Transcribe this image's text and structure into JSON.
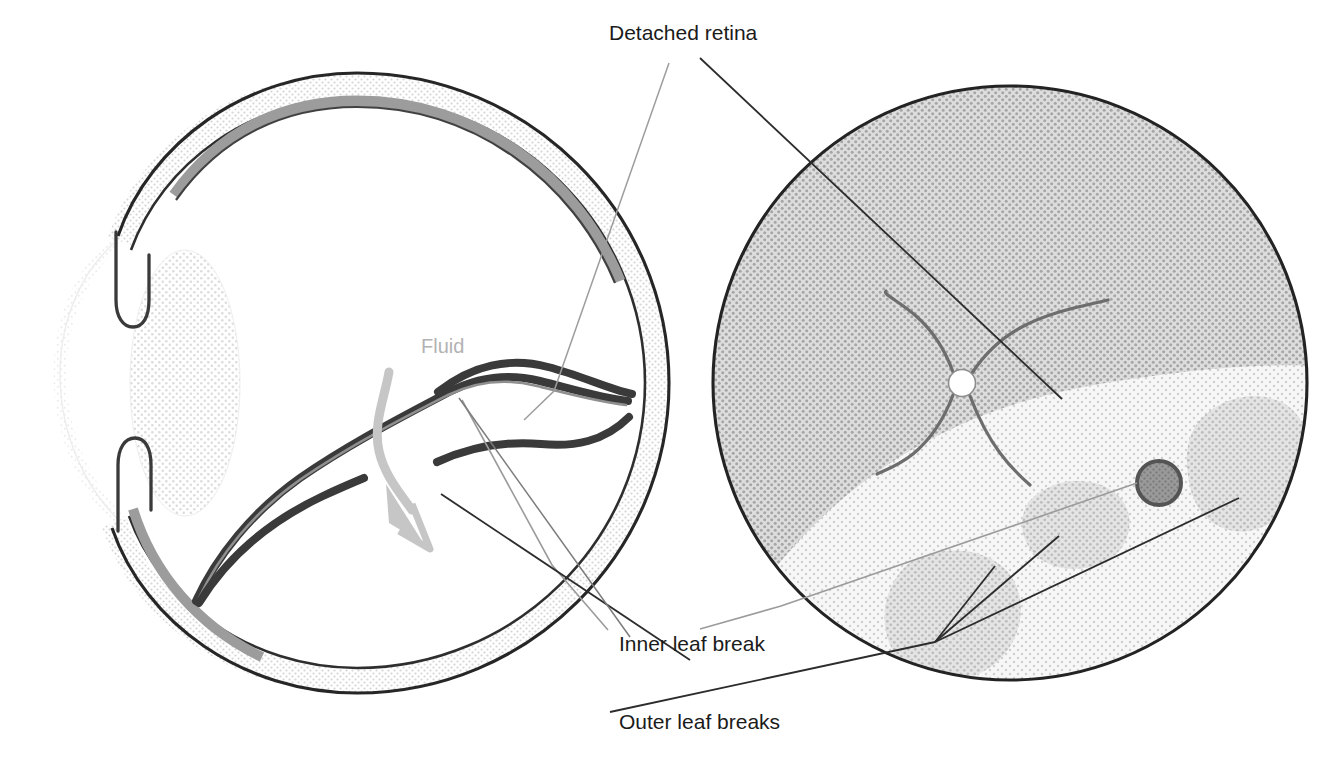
{
  "figure": {
    "background_color": "#ffffff",
    "width": 1344,
    "height": 767
  },
  "labels": [
    {
      "id": "detached-retina",
      "text": "Detached retina",
      "x": 609,
      "y": 40,
      "color": "#1b1b1b",
      "anchor": "start",
      "font_size": 21
    },
    {
      "id": "fluid",
      "text": "Fluid",
      "x": 421,
      "y": 353,
      "color": "#b2b2b2",
      "anchor": "start",
      "font_size": 20
    },
    {
      "id": "inner-leaf-break",
      "text": "Inner leaf break",
      "x": 619,
      "y": 651,
      "color": "#1b1b1b",
      "anchor": "start",
      "font_size": 21
    },
    {
      "id": "outer-leaf-breaks",
      "text": "Outer leaf breaks",
      "x": 619,
      "y": 729,
      "color": "#1b1b1b",
      "anchor": "start",
      "font_size": 21
    }
  ],
  "panels": {
    "left": {
      "name": "eye-cross-section",
      "center_x": 355,
      "center_y": 383,
      "radius": 300,
      "structures": [
        "sclera-wall",
        "cornea",
        "lens",
        "ciliary-body-upper",
        "ciliary-body-lower",
        "attached-retina",
        "detached-retina-fold",
        "retinoschisis-inner-leaf",
        "subretinal-fluid-arrow"
      ]
    },
    "right": {
      "name": "fundus-view",
      "center_x": 1010,
      "center_y": 383,
      "radius": 298,
      "structures": [
        "fundus-background",
        "optic-disc",
        "retinal-vessels",
        "detached-retina-area",
        "outer-leaf-break-patches",
        "inner-leaf-break-hole"
      ]
    }
  },
  "colors": {
    "outline": "#1b1b1b",
    "sclera_fill": "#e8e8e8",
    "attached_retina": "#9c9c9c",
    "lens_fill": "#e0e0e0",
    "fundus_gray": "#c4c4c4",
    "detached_area": "#f0f0f0",
    "patch_gray": "#cfcfcf",
    "hole_fill": "#8d8d8d",
    "hole_ring": "#5e5e5e",
    "vessel": "#6a6a6a",
    "leader_dark": "#2b2b2b",
    "leader_light": "#9a9a9a",
    "fluid_arrow": "#c2c2c2"
  },
  "annotations": {
    "leader_lines": [
      {
        "id": "detached-retina-to-cross-section",
        "style": "light"
      },
      {
        "id": "detached-retina-to-fundus",
        "style": "dark"
      },
      {
        "id": "inner-leaf-break-to-cross-section",
        "style": "light"
      },
      {
        "id": "inner-leaf-break-to-fundus",
        "style": "light"
      },
      {
        "id": "outer-leaf-breaks-to-fundus-a",
        "style": "dark"
      },
      {
        "id": "outer-leaf-breaks-to-fundus-b",
        "style": "dark"
      },
      {
        "id": "outer-leaf-breaks-to-fundus-c",
        "style": "dark"
      }
    ],
    "fluid_arrow": {
      "id": "fluid-flow-arrow",
      "direction": "down-right"
    }
  }
}
